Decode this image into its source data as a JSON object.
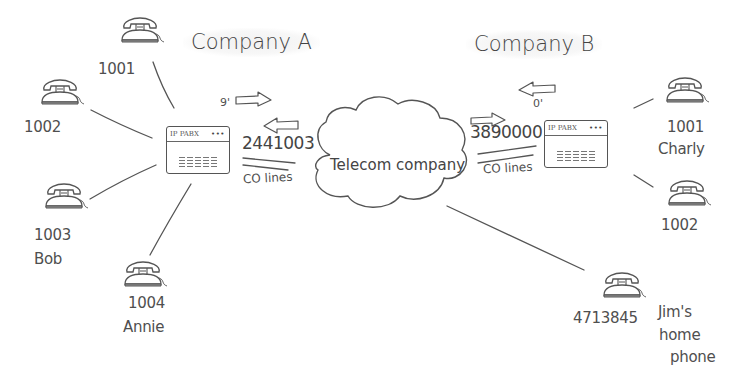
{
  "diagram": {
    "company_a": {
      "title": "Company A",
      "pabx_label": "IP PABX",
      "pabx_dots": "•••",
      "outbound_prefix": "9'",
      "trunk_number": "2441003",
      "co_lines_label": "CO lines",
      "extensions": [
        {
          "number": "1001",
          "name": ""
        },
        {
          "number": "1002",
          "name": ""
        },
        {
          "number": "1003",
          "name": "Bob"
        },
        {
          "number": "1004",
          "name": "Annie"
        }
      ]
    },
    "telecom": {
      "label": "Telecom company"
    },
    "company_b": {
      "title": "Company B",
      "pabx_label": "IP PABX",
      "pabx_dots": "•••",
      "outbound_prefix": "0'",
      "trunk_number": "3890000",
      "co_lines_label": "CO lines",
      "extensions": [
        {
          "number": "1001",
          "name": "Charly"
        },
        {
          "number": "1002",
          "name": ""
        }
      ]
    },
    "home": {
      "number": "4713845",
      "label_line1": "Jim's",
      "label_line2": "home",
      "label_line3": "phone"
    },
    "colors": {
      "stroke": "#555555",
      "text": "#4a4a4a",
      "background": "#ffffff"
    }
  }
}
